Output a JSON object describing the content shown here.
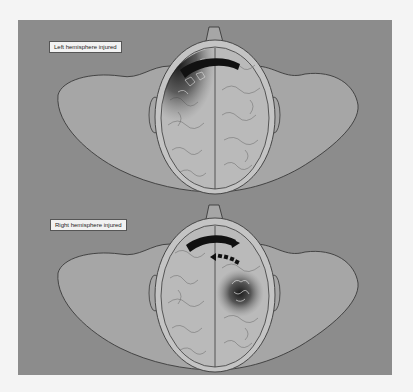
{
  "figures": [
    {
      "label": "Left hemisphere injured",
      "injured_side": "left"
    },
    {
      "label": "Right hemisphere injured",
      "injured_side": "right"
    }
  ],
  "colors": {
    "background": "#8c8c8c",
    "body": "#a6a6a6",
    "skull": "#c4c4c4",
    "brain": "#bababa",
    "outline": "#3a3a3a",
    "injury": "#1a1a1a"
  }
}
